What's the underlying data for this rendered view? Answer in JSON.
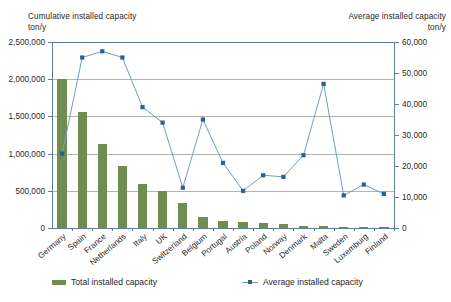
{
  "chart_data": {
    "type": "bar",
    "title": "",
    "left_axis_title": "Cumulative installed capacity\nton/y",
    "right_axis_title": "Average installed capacity\nton/y",
    "xlabel": "",
    "categories": [
      "Germany",
      "Spain",
      "France",
      "Netherlands",
      "Italy",
      "UK",
      "Switzerland",
      "Belgium",
      "Portugal",
      "Austria",
      "Poland",
      "Norway",
      "Denmark",
      "Malta",
      "Sweden",
      "Luxemburg",
      "Finland"
    ],
    "left_ylim": [
      0,
      2500000
    ],
    "left_ticks": [
      "0",
      "500,000",
      "1,000,000",
      "1,500,000",
      "2,000,000",
      "2,500,000"
    ],
    "left_tick_values": [
      0,
      500000,
      1000000,
      1500000,
      2000000,
      2500000
    ],
    "right_ylim": [
      0,
      60000
    ],
    "right_ticks": [
      "0",
      "10,000",
      "20,000",
      "30,000",
      "40,000",
      "50,000",
      "60,000"
    ],
    "right_tick_values": [
      0,
      10000,
      20000,
      30000,
      40000,
      50000,
      60000
    ],
    "grid": true,
    "legend_position": "bottom",
    "series": [
      {
        "name": "Total installed capacity",
        "type": "bar",
        "axis": "left",
        "color": "#6f8d4e",
        "values": [
          2000000,
          1560000,
          1130000,
          830000,
          590000,
          500000,
          330000,
          150000,
          95000,
          75000,
          65000,
          60000,
          30000,
          25000,
          20000,
          15000,
          10000
        ]
      },
      {
        "name": "Average installed capacity",
        "type": "line",
        "axis": "right",
        "color": "#2e5f93",
        "line_color": "#6c9ec9",
        "values": [
          24000,
          55000,
          57000,
          55000,
          39000,
          34000,
          13000,
          35000,
          21000,
          12000,
          17000,
          16500,
          23500,
          46500,
          10500,
          14000,
          11000
        ]
      }
    ]
  },
  "legend": {
    "bar_label": "Total installed capacity",
    "line_label": "Average installed capacity"
  }
}
